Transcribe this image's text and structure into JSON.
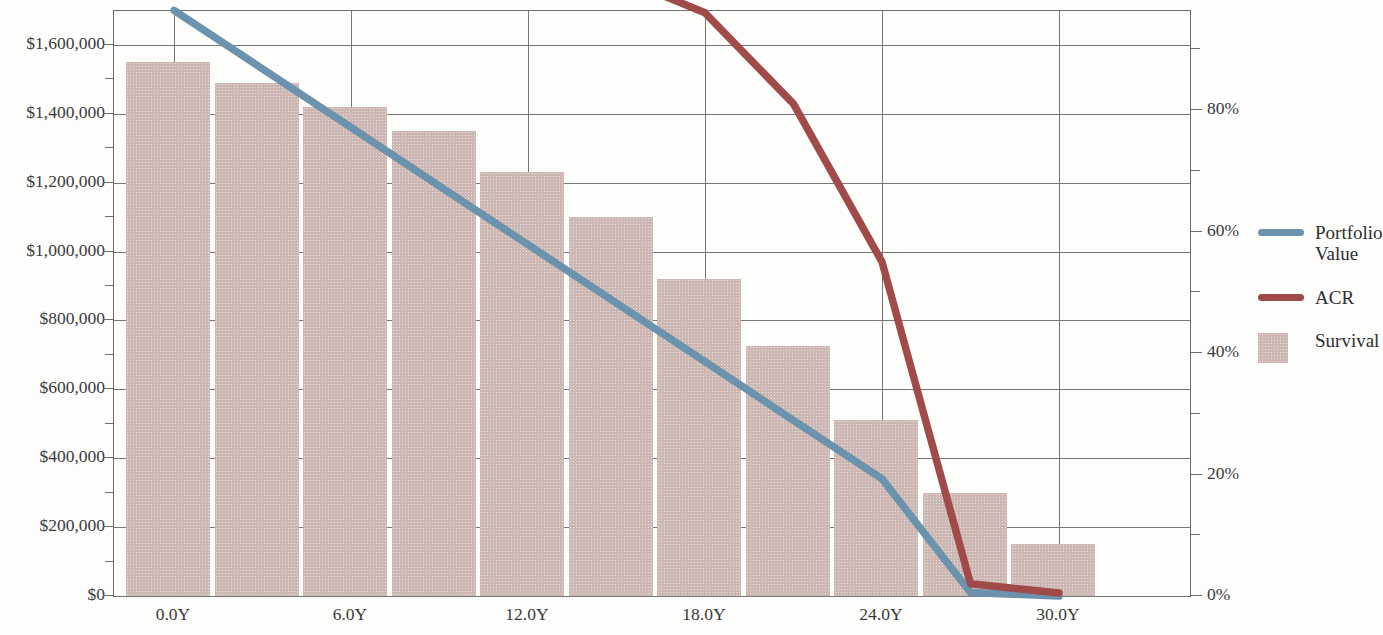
{
  "chart_data": {
    "type": "bar",
    "title": "",
    "subtitle": "",
    "xlabel": "",
    "ylabel": "",
    "y2label": "",
    "grid": true,
    "legend_position": "right",
    "x_ticks": [
      "0.0Y",
      "6.0Y",
      "12.0Y",
      "18.0Y",
      "24.0Y",
      "30.0Y"
    ],
    "x_tick_values": [
      0,
      6,
      12,
      18,
      24,
      30
    ],
    "xlim": [
      0,
      30
    ],
    "y_left_ticks": [
      "$0",
      "$200,000",
      "$400,000",
      "$600,000",
      "$800,000",
      "$1,000,000",
      "$1,200,000",
      "$1,400,000",
      "$1,600,000"
    ],
    "y_left_tick_values": [
      0,
      200000,
      400000,
      600000,
      800000,
      1000000,
      1200000,
      1400000,
      1600000
    ],
    "ylim_left": [
      0,
      1700000
    ],
    "y_right_ticks": [
      "0%",
      "20%",
      "40%",
      "60%",
      "80%",
      "100%"
    ],
    "y_right_tick_values": [
      0,
      20,
      40,
      60,
      80,
      100
    ],
    "ylim_right": [
      0,
      110
    ],
    "categories": [
      0,
      3,
      6,
      9,
      12,
      15,
      18,
      21,
      24,
      27,
      30
    ],
    "series": [
      {
        "name": "Portfolio Value",
        "type": "line",
        "axis": "left",
        "color": "#6b93ad",
        "x": [
          0,
          3,
          6,
          9,
          12,
          15,
          18,
          21,
          24,
          27,
          30
        ],
        "values": [
          1700000,
          1530000,
          1360000,
          1190000,
          1020000,
          850000,
          680000,
          510000,
          340000,
          10000,
          0
        ]
      },
      {
        "name": "ACR",
        "type": "line",
        "axis": "right",
        "color": "#a04a4a",
        "x": [
          0,
          3,
          6,
          9,
          12,
          15,
          18,
          21,
          24,
          27,
          30
        ],
        "values": [
          106,
          108,
          108.5,
          107.5,
          105.5,
          102,
          96,
          81,
          55,
          2,
          0.5
        ]
      },
      {
        "name": "Survival",
        "type": "bar",
        "axis": "left",
        "color": "#cdb7b3",
        "x": [
          0,
          3,
          6,
          9,
          12,
          15,
          18,
          21,
          24,
          27,
          30
        ],
        "values": [
          1550000,
          1490000,
          1420000,
          1350000,
          1230000,
          1100000,
          920000,
          725000,
          510000,
          300000,
          150000
        ]
      }
    ]
  },
  "legend": {
    "items": [
      {
        "label": "Portfolio Value",
        "marker": "line",
        "color": "#6b93ad"
      },
      {
        "label": "ACR",
        "marker": "line",
        "color": "#a04a4a"
      },
      {
        "label": "Survival",
        "marker": "box",
        "color": "#cdb7b3"
      }
    ]
  }
}
